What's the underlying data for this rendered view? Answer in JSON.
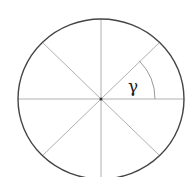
{
  "diagram": {
    "type": "circle-with-radial-lines",
    "center": {
      "x": 101,
      "y": 99
    },
    "radius": {
      "rx": 83,
      "ry": 80
    },
    "circle_color": "#444444",
    "line_color": "#b0b0b0",
    "radial_line_count": 8,
    "radial_angles_deg": [
      0,
      45,
      90,
      135,
      180,
      225,
      270,
      315
    ],
    "angle_arc": {
      "from_deg": 0,
      "to_deg": 45,
      "radius": 54,
      "color": "#999999"
    },
    "angle_label": "γ"
  }
}
